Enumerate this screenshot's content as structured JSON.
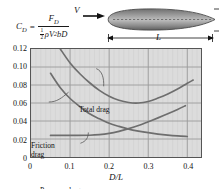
{
  "equation": {
    "lhs": "C",
    "lhs_sub": "D",
    "equals": "=",
    "numerator": "F",
    "numerator_sub": "D",
    "denominator_half": "1",
    "denominator_half_den": "2",
    "denominator_rho": "ρV",
    "denominator_exp": "2",
    "denominator_tail": "bD"
  },
  "diagram": {
    "velocity_label": "V",
    "diameter_label": "D",
    "length_label": "L",
    "velocity_arrow_icon": "right-arrow-icon",
    "body_icon": "streamlined-body-icon"
  },
  "chart_data": {
    "type": "line",
    "title": "",
    "xlabel": "D/L",
    "ylabel": "",
    "xlim": [
      0,
      0.435
    ],
    "ylim": [
      0,
      0.12
    ],
    "xticks": [
      0,
      0.1,
      0.2,
      0.3,
      0.4
    ],
    "xtick_labels": [
      "0",
      "0.1",
      "0.2",
      "0.3",
      "0.4"
    ],
    "yticks": [
      0,
      0.02,
      0.04,
      0.06,
      0.08,
      0.1,
      0.12
    ],
    "ytick_labels": [
      "0",
      "0.02",
      "0.04",
      "0.06",
      "0.08",
      "0.10",
      "0.12"
    ],
    "grid": true,
    "legend": "inline-annotations",
    "series": [
      {
        "name": "Total drag",
        "label": "Total drag",
        "color": "#6e6e6e",
        "x": [
          0.075,
          0.1,
          0.125,
          0.15,
          0.175,
          0.2,
          0.225,
          0.25,
          0.275,
          0.3,
          0.325,
          0.35,
          0.375,
          0.4,
          0.415
        ],
        "y": [
          0.12,
          0.1045,
          0.0925,
          0.0825,
          0.074,
          0.0675,
          0.063,
          0.0605,
          0.06,
          0.0617,
          0.0655,
          0.07,
          0.0755,
          0.082,
          0.0855
        ]
      },
      {
        "name": "Friction drag",
        "label": "Friction drag",
        "color": "#6e6e6e",
        "x": [
          0.05,
          0.075,
          0.1,
          0.125,
          0.15,
          0.175,
          0.2,
          0.225,
          0.25,
          0.275,
          0.3,
          0.325,
          0.35,
          0.375,
          0.4
        ],
        "y": [
          0.093,
          0.077,
          0.065,
          0.056,
          0.048,
          0.0425,
          0.0375,
          0.034,
          0.031,
          0.0288,
          0.027,
          0.0255,
          0.0243,
          0.0234,
          0.0228
        ]
      },
      {
        "name": "Pressure drag",
        "label": "Pressure drag",
        "color": "#6e6e6e",
        "x": [
          0.05,
          0.1,
          0.15,
          0.175,
          0.2,
          0.225,
          0.25,
          0.275,
          0.3,
          0.325,
          0.35,
          0.375,
          0.395
        ],
        "y": [
          0.024,
          0.024,
          0.0242,
          0.0248,
          0.0262,
          0.0285,
          0.0315,
          0.035,
          0.0392,
          0.0435,
          0.048,
          0.0528,
          0.057
        ]
      }
    ],
    "annotations": [
      {
        "text": "Total drag",
        "points_to_series": "Total drag"
      },
      {
        "text": "Friction drag",
        "points_to_series": "Friction drag"
      },
      {
        "text": "Pressure drag",
        "points_to_series": "Pressure drag"
      }
    ]
  },
  "colors": {
    "plot_background": "#dcdcdc",
    "curve": "#6e6e6e",
    "gridline_major": "#9a9a9a",
    "gridline_minor": "#cfcfcf",
    "frame": "#555555",
    "text": "#111111",
    "body_fill": "#8a8a8a"
  }
}
